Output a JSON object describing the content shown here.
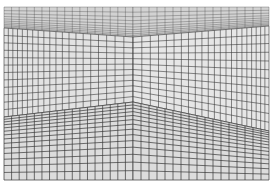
{
  "image": {
    "subject": "perspective room with gridded walls, ceiling and floor",
    "colors": {
      "background": "#ffffff",
      "ceiling": "#d2d2d2",
      "left_wall": "#e2e2e2",
      "right_wall": "#e6e6e6",
      "floor": "#dcdcdc",
      "grid_line": "#3a3a3a"
    },
    "frame": {
      "left": 4,
      "top": 7,
      "right": 269,
      "bottom": 180
    },
    "vertices": {
      "back_top": [
        133,
        37
      ],
      "back_bottom": [
        133,
        102
      ],
      "left_top": [
        4,
        28
      ],
      "left_bottom": [
        4,
        117
      ],
      "right_top": [
        269,
        26
      ],
      "right_bottom": [
        269,
        131
      ]
    },
    "grid": {
      "wall_cols_left": 20,
      "wall_cols_right": 22,
      "wall_rows": 12,
      "ceiling_rows": 10,
      "floor_rows": 14,
      "ceiling_cols": 34,
      "floor_cols": 34
    }
  }
}
